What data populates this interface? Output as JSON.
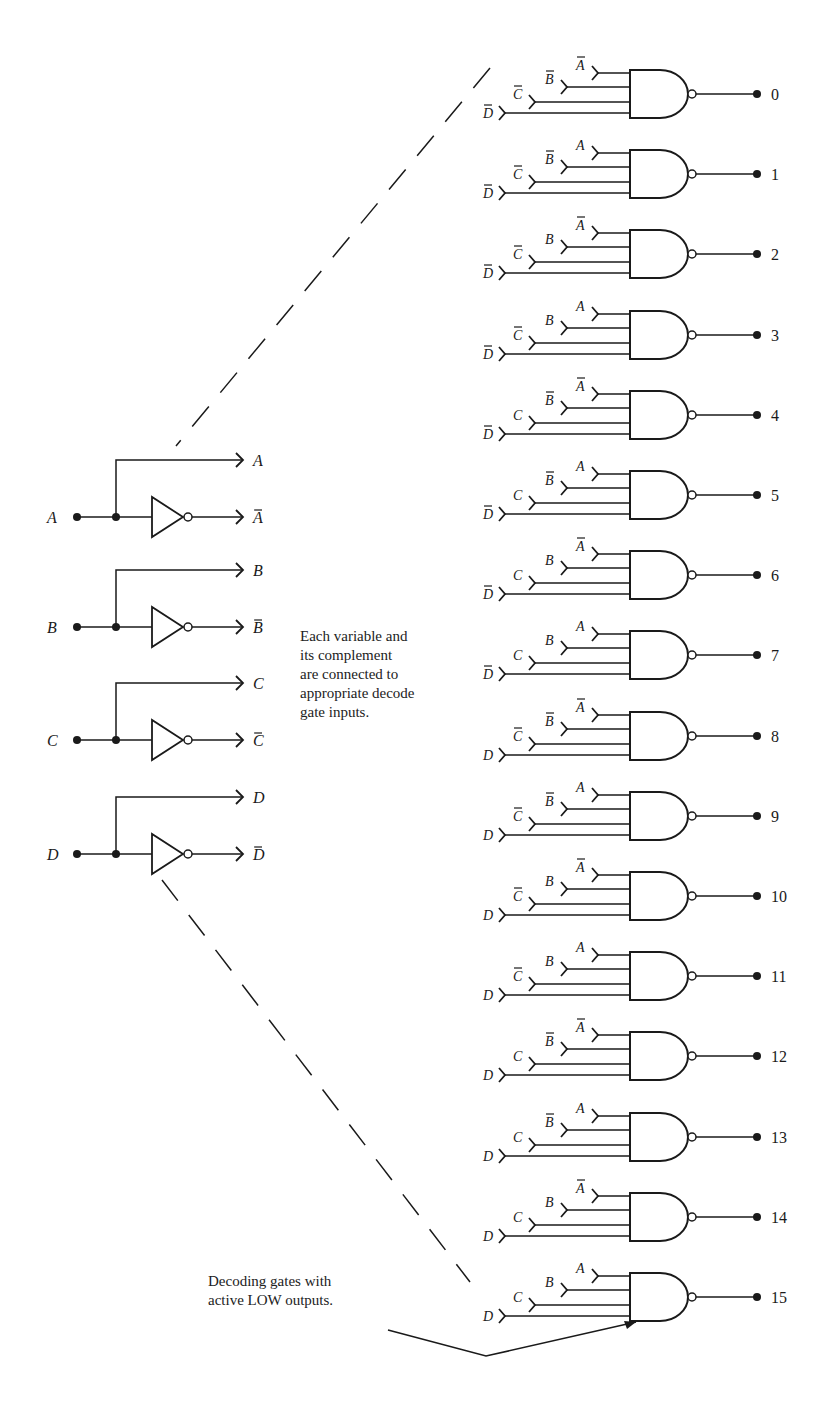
{
  "diagram": {
    "inputs": [
      {
        "name": "A",
        "true_label": "A",
        "comp_label": "A"
      },
      {
        "name": "B",
        "true_label": "B",
        "comp_label": "B"
      },
      {
        "name": "C",
        "true_label": "C",
        "comp_label": "C"
      },
      {
        "name": "D",
        "true_label": "D",
        "comp_label": "D"
      }
    ],
    "gates": [
      {
        "output": "0",
        "A": true,
        "B": true,
        "C": true,
        "D": true
      },
      {
        "output": "1",
        "A": false,
        "B": true,
        "C": true,
        "D": true
      },
      {
        "output": "2",
        "A": true,
        "B": false,
        "C": true,
        "D": true
      },
      {
        "output": "3",
        "A": false,
        "B": false,
        "C": true,
        "D": true
      },
      {
        "output": "4",
        "A": true,
        "B": true,
        "C": false,
        "D": true
      },
      {
        "output": "5",
        "A": false,
        "B": true,
        "C": false,
        "D": true
      },
      {
        "output": "6",
        "A": true,
        "B": false,
        "C": false,
        "D": true
      },
      {
        "output": "7",
        "A": false,
        "B": false,
        "C": false,
        "D": true
      },
      {
        "output": "8",
        "A": true,
        "B": true,
        "C": true,
        "D": false
      },
      {
        "output": "9",
        "A": false,
        "B": true,
        "C": true,
        "D": false
      },
      {
        "output": "10",
        "A": true,
        "B": false,
        "C": true,
        "D": false
      },
      {
        "output": "11",
        "A": false,
        "B": false,
        "C": true,
        "D": false
      },
      {
        "output": "12",
        "A": true,
        "B": true,
        "C": false,
        "D": false
      },
      {
        "output": "13",
        "A": false,
        "B": true,
        "C": false,
        "D": false
      },
      {
        "output": "14",
        "A": true,
        "B": false,
        "C": false,
        "D": false
      },
      {
        "output": "15",
        "A": false,
        "B": false,
        "C": false,
        "D": false
      }
    ],
    "note_connections": [
      "Each variable and",
      "its complement",
      "are connected to",
      "appropriate decode",
      "gate inputs."
    ],
    "note_gates": [
      "Decoding gates with",
      "active LOW outputs."
    ],
    "ink_color": "#1a1a1a"
  }
}
